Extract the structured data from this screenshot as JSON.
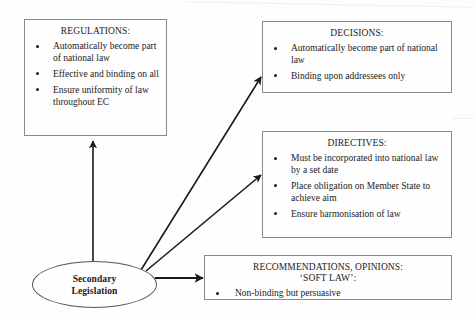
{
  "diagram": {
    "title": "Secondary Legislation",
    "source_node": {
      "label_line1": "Secondary",
      "label_line2": "Legislation",
      "shape": "ellipse"
    },
    "boxes": [
      {
        "id": "regulations",
        "title": "REGULATIONS:",
        "bullets": [
          "Automatically become part of national law",
          "Effective and binding on all",
          "Ensure uniformity of law throughout EC"
        ]
      },
      {
        "id": "decisions",
        "title": "DECISIONS:",
        "bullets": [
          "Automatically become part of national law",
          "Binding upon addressees only"
        ]
      },
      {
        "id": "directives",
        "title": "DIRECTIVES:",
        "bullets": [
          "Must be incorporated into national law by a set date",
          "Place obligation on Member State to achieve aim",
          "Ensure harmonisation of law"
        ]
      },
      {
        "id": "recommendations",
        "title_line1": "RECOMMENDATIONS, OPINIONS:",
        "title_line2": "‘SOFT LAW’:",
        "bullets": [
          "Non-binding but persuasive"
        ]
      }
    ],
    "connectors": [
      {
        "from": "secondary-legislation",
        "to": "regulations",
        "direction": "up"
      },
      {
        "from": "secondary-legislation",
        "to": "decisions",
        "direction": "up-right"
      },
      {
        "from": "secondary-legislation",
        "to": "directives",
        "direction": "up-right"
      },
      {
        "from": "secondary-legislation",
        "to": "recommendations",
        "direction": "right"
      }
    ],
    "colors": {
      "background": "#fefefe",
      "box_border": "#8a8a8a",
      "ellipse_border": "#55565a",
      "text": "#1a1a1a",
      "arrow": "#1a1a1a"
    }
  }
}
